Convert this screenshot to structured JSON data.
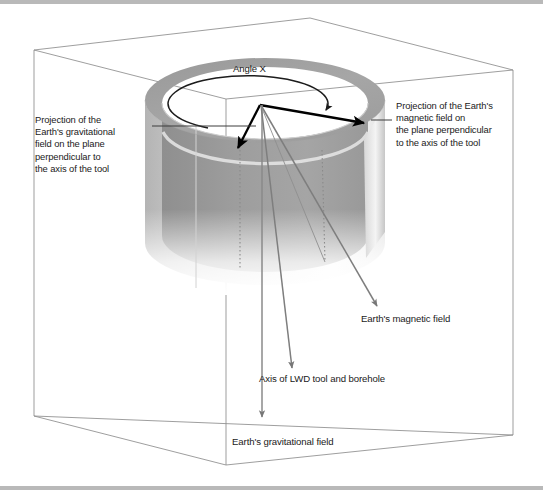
{
  "figure": {
    "background_color": "#ffffff",
    "rule_color": "#b9b9b9"
  },
  "labels": {
    "gravitational_projection": "Projection of the\nEarth's gravitational\nfield on the plane\nperpendicular to\nthe axis of the tool",
    "magnetic_projection": "Projection of the Earth's\nmagnetic field on\nthe plane perpendicular\nto the axis of the tool",
    "angle_x": "Angle X",
    "earth_magnetic_field": "Earth's magnetic field",
    "axis_lwd_tool": "Axis of LWD tool and borehole",
    "earth_gravitational_field": "Earth's gravitational field"
  },
  "colors": {
    "box_wireframe": "#8d8d8d",
    "cylinder_top_rim": "#a3a3a3",
    "cylinder_inner_wall": "#9b9b9b",
    "cylinder_outer_wall_light": "#f2f2f2",
    "cylinder_outer_wall_dark": "#a8a8a8",
    "vector_bold": "#000000",
    "vector_thin": "#6e6e6e",
    "leader_line": "#4a4a4a",
    "text": "#1a1a1a"
  },
  "geometry": {
    "box": {
      "top_back_left": [
        34,
        50
      ],
      "top_apex": [
        310,
        18
      ],
      "top_back_right": [
        513,
        70
      ],
      "top_front": [
        226,
        99
      ],
      "bottom_left": [
        34,
        416
      ],
      "bottom_right": [
        513,
        435
      ],
      "bottom_front": [
        226,
        465
      ]
    },
    "cylinder": {
      "center_top": [
        265,
        100
      ],
      "radius_x": 120,
      "radius_y": 42,
      "wall_thickness": 17,
      "height": 175
    },
    "vectors": {
      "origin": [
        260,
        105
      ],
      "gravitational_projection_tip": [
        239,
        146
      ],
      "magnetic_projection_tip": [
        366,
        122
      ],
      "tool_axis_tip": [
        293,
        367
      ],
      "magnetic_field_tip": [
        378,
        305
      ],
      "gravitational_field_tip": [
        262,
        415
      ]
    },
    "angle_arc": {
      "center": [
        265,
        100
      ],
      "radius_x": 80,
      "radius_y": 28,
      "arrow_tip": [
        330,
        107
      ]
    }
  }
}
